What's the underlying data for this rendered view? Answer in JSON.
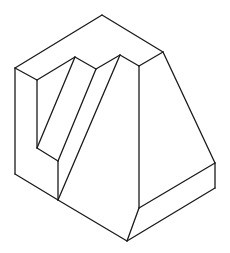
{
  "diagram": {
    "type": "isometric-line-drawing",
    "stroke_color": "#1a1a1a",
    "background": "#ffffff",
    "stroke_width": 1.3,
    "edges": [
      [
        15,
        68,
        102,
        15
      ],
      [
        102,
        15,
        163,
        52
      ],
      [
        15,
        68,
        37,
        80
      ],
      [
        37,
        80,
        75,
        57
      ],
      [
        75,
        57,
        96,
        69
      ],
      [
        96,
        69,
        120,
        55
      ],
      [
        120,
        55,
        139,
        66
      ],
      [
        139,
        66,
        163,
        52
      ],
      [
        15,
        68,
        15,
        174
      ],
      [
        37,
        80,
        37,
        148
      ],
      [
        75,
        57,
        37,
        148
      ],
      [
        96,
        69,
        58,
        161
      ],
      [
        120,
        55,
        58,
        200
      ],
      [
        37,
        148,
        58,
        161
      ],
      [
        58,
        161,
        58,
        200
      ],
      [
        15,
        174,
        58,
        200
      ],
      [
        58,
        200,
        127,
        241
      ],
      [
        139,
        66,
        139,
        208
      ],
      [
        139,
        208,
        127,
        241
      ],
      [
        163,
        52,
        215,
        163
      ],
      [
        215,
        163,
        215,
        188
      ],
      [
        139,
        208,
        215,
        163
      ],
      [
        127,
        241,
        215,
        188
      ]
    ]
  }
}
